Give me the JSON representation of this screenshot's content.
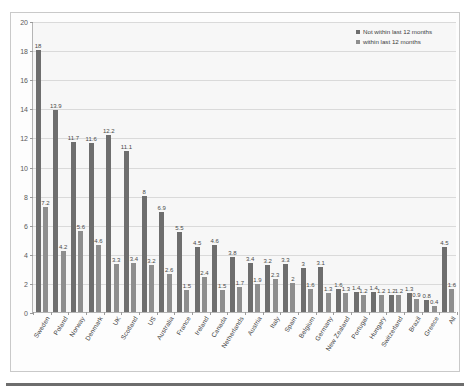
{
  "chart_data": {
    "type": "bar",
    "title": "",
    "subtitle": "",
    "xlabel": "",
    "ylabel": "",
    "ylim": [
      0,
      20
    ],
    "ytick_step": 2,
    "yticks": [
      "0",
      "2",
      "4",
      "6",
      "8",
      "10",
      "12",
      "14",
      "16",
      "18",
      "20"
    ],
    "grid": true,
    "legend_position": "top-right",
    "categories": [
      "Sweden",
      "Poland",
      "Norway",
      "Denmark",
      "UK",
      "Scotland",
      "US",
      "Australia",
      "France",
      "Ireland",
      "Canada",
      "Netherlands",
      "Austria",
      "Italy",
      "Spain",
      "Belgium",
      "Germany",
      "New Zealand",
      "Portugal",
      "Hungary",
      "Switzerland",
      "Brazil",
      "Greece",
      "All"
    ],
    "series": [
      {
        "name": "Not within last 12 months",
        "color": "#6e6e6e",
        "values": [
          18,
          13.9,
          11.7,
          11.6,
          12.2,
          11.1,
          8,
          6.9,
          5.5,
          4.5,
          4.6,
          3.8,
          3.4,
          3.2,
          3.3,
          3,
          3.1,
          1.6,
          1.4,
          1.4,
          1.2,
          1.3,
          0.8,
          4.5
        ]
      },
      {
        "name": "within last 12 months",
        "color": "#8e8e8e",
        "values": [
          7.2,
          4.2,
          5.6,
          4.6,
          3.3,
          3.4,
          3.2,
          2.6,
          1.5,
          2.4,
          1.5,
          1.7,
          1.9,
          2.3,
          2,
          1.6,
          1.3,
          1.3,
          1.2,
          1.2,
          1.2,
          0.9,
          0.4,
          1.6
        ]
      }
    ]
  },
  "legend": {
    "items": [
      {
        "label": "Not within last 12 months"
      },
      {
        "label": "within last 12 months"
      }
    ]
  },
  "watermark": {
    "text": "Sample Chart"
  }
}
